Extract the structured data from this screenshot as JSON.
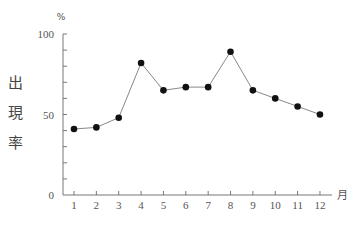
{
  "chart_data": {
    "type": "line",
    "title": "",
    "xlabel": "月",
    "ylabel": "出現率",
    "y_unit": "%",
    "categories": [
      "1",
      "2",
      "3",
      "4",
      "5",
      "6",
      "7",
      "8",
      "9",
      "10",
      "11",
      "12"
    ],
    "values": [
      41,
      42,
      48,
      82,
      65,
      67,
      67,
      89,
      65,
      60,
      55,
      50
    ],
    "ylim": [
      0,
      100
    ],
    "y_ticks_labeled": [
      0,
      50,
      100
    ],
    "y_minor_tick_step": 10,
    "grid": false,
    "legend": null,
    "marker": "filled-circle"
  }
}
